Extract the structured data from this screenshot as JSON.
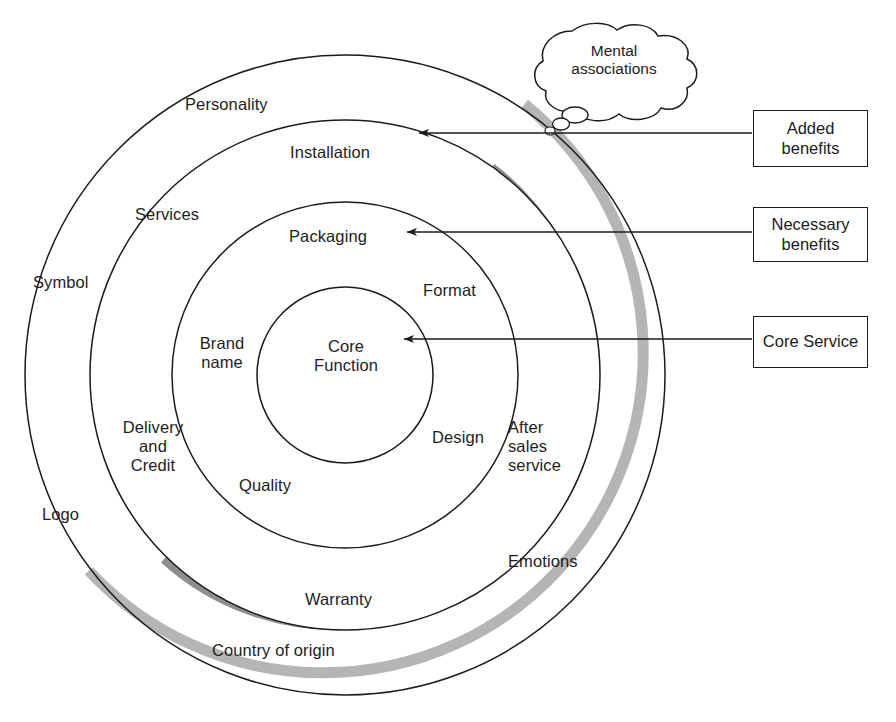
{
  "diagram": {
    "type": "concentric-circles",
    "center": {
      "x": 345,
      "y": 375
    },
    "rings": [
      {
        "name": "outer",
        "radius": 320,
        "shadow": "#a8a8a8"
      },
      {
        "name": "third",
        "radius": 255,
        "shadow": "#8a8a8a"
      },
      {
        "name": "second",
        "radius": 173,
        "shadow": "#757575"
      },
      {
        "name": "core",
        "radius": 88,
        "shadow": "#8a8a8a"
      }
    ],
    "colors": {
      "stroke": "#1b1b1b",
      "ring_shadow_outer": "#b0b0b0",
      "ring_shadow_mid": "#8d8d8d",
      "ring_shadow_inner": "#6e6e6e",
      "background": "#ffffff",
      "box_border": "#1b1b1b",
      "caption_color": "#9a9a9a"
    },
    "core_label": "Core\nFunction",
    "ring_labels": [
      {
        "id": "personality",
        "text": "Personality",
        "x": 185,
        "y": 95,
        "align": "left"
      },
      {
        "id": "symbol",
        "text": "Symbol",
        "x": 33,
        "y": 273,
        "align": "left"
      },
      {
        "id": "logo",
        "text": "Logo",
        "x": 42,
        "y": 505,
        "align": "left"
      },
      {
        "id": "country-of-origin",
        "text": "Country of origin",
        "x": 212,
        "y": 641,
        "align": "left"
      },
      {
        "id": "installation",
        "text": "Installation",
        "x": 290,
        "y": 143,
        "align": "left"
      },
      {
        "id": "services",
        "text": "Services",
        "x": 135,
        "y": 205,
        "align": "left"
      },
      {
        "id": "delivery-credit",
        "text": "Delivery\nand\nCredit",
        "x": 112,
        "y": 418,
        "align": "left"
      },
      {
        "id": "warranty",
        "text": "Warranty",
        "x": 305,
        "y": 590,
        "align": "left"
      },
      {
        "id": "emotions",
        "text": "Emotions",
        "x": 508,
        "y": 552,
        "align": "left"
      },
      {
        "id": "packaging",
        "text": "Packaging",
        "x": 289,
        "y": 227,
        "align": "left"
      },
      {
        "id": "brand-name",
        "text": "Brand\nname",
        "x": 194,
        "y": 334,
        "align": "left"
      },
      {
        "id": "quality",
        "text": "Quality",
        "x": 239,
        "y": 476,
        "align": "left"
      },
      {
        "id": "after-sales",
        "text": "After\nsales\nservice",
        "x": 508,
        "y": 418,
        "align": "left"
      },
      {
        "id": "format",
        "text": "Format",
        "x": 423,
        "y": 281,
        "align": "left"
      },
      {
        "id": "design",
        "text": "Design",
        "x": 432,
        "y": 428,
        "align": "left"
      }
    ],
    "thought_bubble": {
      "text": "Mental\nassociations",
      "x": 538,
      "y": 42,
      "width": 152,
      "height": 66
    },
    "callouts": [
      {
        "id": "added-benefits",
        "label": "Added\nbenefits",
        "box": {
          "x": 753,
          "y": 110,
          "w": 115,
          "h": 57
        },
        "arrow_tip": {
          "x": 414,
          "y": 133
        }
      },
      {
        "id": "necessary-benefits",
        "label": "Necessary\nbenefits",
        "box": {
          "x": 753,
          "y": 207,
          "w": 115,
          "h": 55
        },
        "arrow_tip": {
          "x": 402,
          "y": 232
        }
      },
      {
        "id": "core-service",
        "label": "Core Service",
        "box": {
          "x": 753,
          "y": 316,
          "w": 115,
          "h": 52
        },
        "arrow_tip": {
          "x": 399,
          "y": 339
        }
      }
    ],
    "caption": ""
  }
}
